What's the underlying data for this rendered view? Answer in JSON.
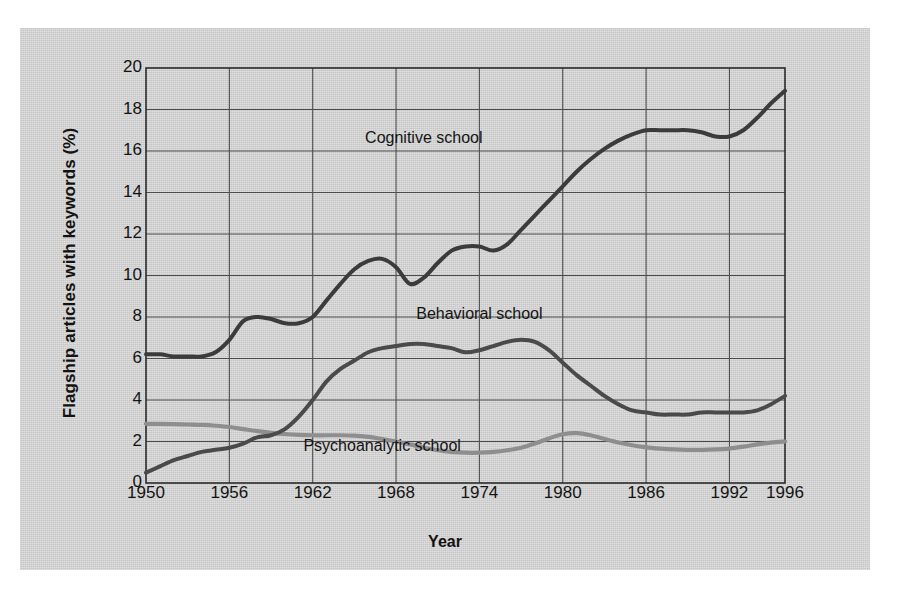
{
  "chart_data": {
    "type": "line",
    "title": "",
    "xlabel": "Year",
    "ylabel": "Flagship articles with keywords (%)",
    "xlim": [
      1950,
      1996
    ],
    "ylim": [
      0,
      20
    ],
    "ytick_step": 2,
    "grid": true,
    "legend_position": "inline-annotations",
    "xticks": [
      "1950",
      "1956",
      "1962",
      "1968",
      "1974",
      "1980",
      "1986",
      "1992",
      "1996"
    ],
    "xtick_values": [
      1950,
      1956,
      1962,
      1968,
      1974,
      1980,
      1986,
      1992,
      1996
    ],
    "yticks": [
      "0",
      "2",
      "4",
      "6",
      "8",
      "10",
      "12",
      "14",
      "16",
      "18",
      "20"
    ],
    "ytick_values": [
      0,
      2,
      4,
      6,
      8,
      10,
      12,
      14,
      16,
      18,
      20
    ],
    "x": [
      1950,
      1951,
      1952,
      1953,
      1954,
      1955,
      1956,
      1957,
      1958,
      1959,
      1960,
      1961,
      1962,
      1963,
      1964,
      1965,
      1966,
      1967,
      1968,
      1969,
      1970,
      1971,
      1972,
      1973,
      1974,
      1975,
      1976,
      1977,
      1978,
      1979,
      1980,
      1981,
      1982,
      1983,
      1984,
      1985,
      1986,
      1987,
      1988,
      1989,
      1990,
      1991,
      1992,
      1993,
      1994,
      1995,
      1996
    ],
    "series": [
      {
        "name": "Cognitive school",
        "color": "#3b3b3b",
        "label_x": 1970,
        "label_y": 16.6,
        "values": [
          6.2,
          6.2,
          6.1,
          6.1,
          6.1,
          6.3,
          6.9,
          7.8,
          8.0,
          7.9,
          7.7,
          7.7,
          8.0,
          8.8,
          9.6,
          10.3,
          10.7,
          10.8,
          10.4,
          9.6,
          9.9,
          10.6,
          11.2,
          11.4,
          11.4,
          11.2,
          11.5,
          12.2,
          12.9,
          13.6,
          14.3,
          15.0,
          15.6,
          16.1,
          16.5,
          16.8,
          17.0,
          17.0,
          17.0,
          17.0,
          16.9,
          16.7,
          16.7,
          17.0,
          17.6,
          18.3,
          18.9
        ]
      },
      {
        "name": "Behavioral school",
        "color": "#4a4a4a",
        "label_x": 1974,
        "label_y": 8.1,
        "values": [
          0.5,
          0.8,
          1.1,
          1.3,
          1.5,
          1.6,
          1.7,
          1.9,
          2.2,
          2.3,
          2.6,
          3.2,
          4.0,
          4.9,
          5.5,
          5.9,
          6.3,
          6.5,
          6.6,
          6.7,
          6.7,
          6.6,
          6.5,
          6.3,
          6.4,
          6.6,
          6.8,
          6.9,
          6.8,
          6.4,
          5.8,
          5.2,
          4.7,
          4.2,
          3.8,
          3.5,
          3.4,
          3.3,
          3.3,
          3.3,
          3.4,
          3.4,
          3.4,
          3.4,
          3.5,
          3.8,
          4.2
        ]
      },
      {
        "name": "Psychoanalytic school",
        "color": "#8e8e8e",
        "label_x": 1967,
        "label_y": 1.75,
        "values": [
          2.85,
          2.85,
          2.84,
          2.82,
          2.8,
          2.76,
          2.7,
          2.6,
          2.5,
          2.42,
          2.36,
          2.32,
          2.3,
          2.3,
          2.3,
          2.28,
          2.22,
          2.12,
          2.0,
          1.86,
          1.7,
          1.58,
          1.5,
          1.46,
          1.46,
          1.5,
          1.58,
          1.7,
          1.9,
          2.15,
          2.35,
          2.4,
          2.3,
          2.12,
          1.95,
          1.82,
          1.72,
          1.66,
          1.62,
          1.6,
          1.6,
          1.62,
          1.66,
          1.75,
          1.86,
          1.95,
          2.0
        ]
      }
    ]
  },
  "figure": {
    "background_color": "#d3d3d3",
    "axis_color": "#2a2a2a",
    "grid_color": "#4d4d4d"
  }
}
